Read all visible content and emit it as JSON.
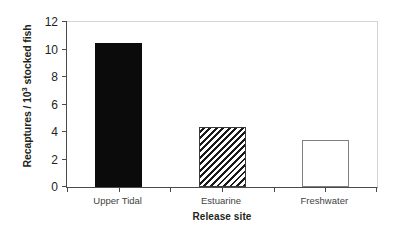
{
  "chart_data": {
    "type": "bar",
    "title": "",
    "subtitle": "",
    "categories": [
      "Upper Tidal",
      "Estuarine",
      "Freshwater"
    ],
    "values": [
      10.45,
      4.35,
      3.4
    ],
    "series": [
      {
        "name": "Recaptures per 1000 stocked fish",
        "values": [
          10.45,
          4.35,
          3.4
        ]
      }
    ],
    "xlabel": "Release site",
    "ylabel_parts": {
      "prefix": "Recaptures / 10",
      "superscript": "3",
      "suffix": " stocked fish"
    },
    "ylabel": "Recaptures / 10^3 stocked fish",
    "ylim": [
      0,
      12
    ],
    "yticks": [
      "0",
      "2",
      "4",
      "6",
      "8",
      "10",
      "12"
    ],
    "ytick_values": [
      0,
      2,
      4,
      6,
      8,
      10,
      12
    ],
    "grid": false,
    "legend": "none",
    "bar_styles": [
      "solid-black",
      "diagonal-hatch",
      "open-white"
    ],
    "colors": {
      "bar_solid": "#0b0b0b",
      "bar_hatch_line": "#1a1a1a",
      "bar_hatch_fill": "#ffffff",
      "bar_open_border": "#808080",
      "bar_open_fill": "#ffffff",
      "axis": "#4a4a4a",
      "frame": "#d4d4d4",
      "text": "#231f20",
      "tick_label": "#3f3f3f",
      "background": "#ffffff"
    }
  }
}
